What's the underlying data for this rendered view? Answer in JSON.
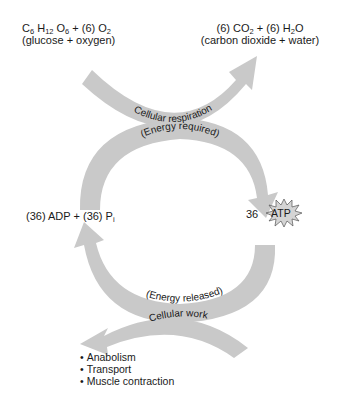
{
  "reactants": {
    "formula": [
      "C",
      "6",
      "H",
      "12",
      "O",
      "6",
      " + (6) O",
      "2"
    ],
    "formula_text": "C6H12O6 + (6) O2",
    "names": "(glucose + oxygen)"
  },
  "products": {
    "formula_text": "(6) CO2 + (6) H2O",
    "names": "(carbon dioxide + water)"
  },
  "arrows": {
    "top": "Cellular respiration",
    "cycle_top": "(Energy required)",
    "cycle_bottom": "(Energy released)",
    "bottom": "Cellular work"
  },
  "left_label": {
    "text": "(36) ADP + (36) P",
    "subscript": "i"
  },
  "atp": {
    "count": "36",
    "label": "ATP"
  },
  "work_list": [
    "Anabolism",
    "Transport",
    "Muscle contraction"
  ],
  "colors": {
    "arrow_fill": "#c9c9c9",
    "starburst_fill": "#d4d4d4",
    "text": "#1a1a1a"
  }
}
